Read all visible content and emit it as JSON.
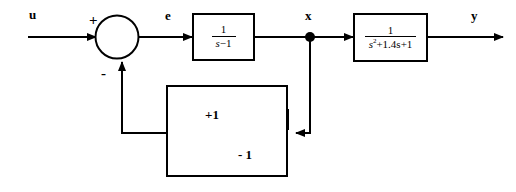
{
  "diagram": {
    "signals": {
      "input": "u",
      "error": "e",
      "state": "x",
      "output": "y"
    },
    "summing_junction": {
      "plus_sign": "+",
      "minus_sign": "-"
    },
    "blocks": [
      {
        "name": "plant-first-order",
        "numerator": "1",
        "denominator_main": "s",
        "denominator_rest": "−1",
        "expression": "1/(s-1)"
      },
      {
        "name": "plant-second-order",
        "numerator": "1",
        "denominator_main": "s",
        "denominator_exp": "2",
        "denominator_rest": "+1.4s+1",
        "expression": "1/(s^2+1.4s+1)"
      }
    ],
    "relay": {
      "name": "relay-hysteresis",
      "upper_level": "+1",
      "lower_level": "- 1"
    },
    "colors": {
      "line": "#000000",
      "fill": "#ffffff",
      "hatch": "#b8b8b8"
    }
  }
}
